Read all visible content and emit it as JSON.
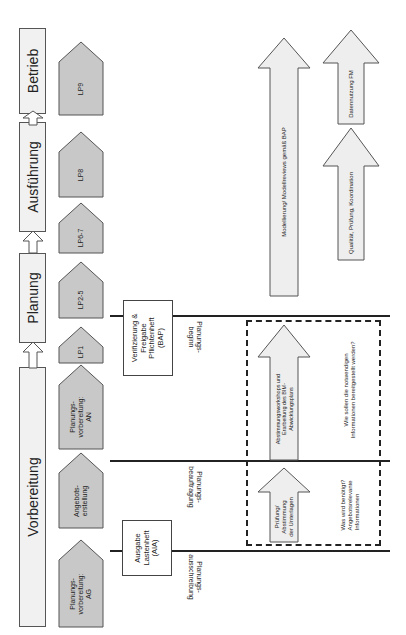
{
  "phases": [
    {
      "label": "Vorbereitung"
    },
    {
      "label": "Planung"
    },
    {
      "label": "Ausführung"
    },
    {
      "label": "Betrieb"
    }
  ],
  "steps": [
    {
      "label": "Planungs-\nvorbereitung:\nAG"
    },
    {
      "label": "Angebots-\nerstellung"
    },
    {
      "label": "Planungs-\nvorbereitung:\nAN"
    },
    {
      "label": "LP1"
    },
    {
      "label": "LP2-5"
    },
    {
      "label": "LP6-7"
    },
    {
      "label": "LP8"
    },
    {
      "label": "LP9"
    }
  ],
  "documents": [
    {
      "label": "Ausgabe\nLastenheft\n(AIA)"
    },
    {
      "label": "Verifizierung &\nFreigabe\nPflichtenheft\n(BAP)"
    }
  ],
  "milestones": [
    {
      "label": "Planungs-\nausschreibung"
    },
    {
      "label": "Planungs-\nbeauftragung"
    },
    {
      "label": "Planungs-\nbeginn"
    }
  ],
  "arrows": [
    {
      "label": "Prüfung/\nAbstimmung\nder Unterlagen"
    },
    {
      "label": "Abstimmungsworkshops und\nErarbeitung des BIM-\nAbwicklungsplans"
    },
    {
      "label": "Modellierung/ Modellreviews gemäß BAP"
    },
    {
      "label": "Qualität, Prüfung, Koordination"
    },
    {
      "label": "Datennutzung FM"
    }
  ],
  "notes": [
    {
      "label": "Was wird benötigt?\nAngebotsrelevante\nInformationen"
    },
    {
      "label": "Wie sollen die notwendigen\nInformationen bereitgestellt werden?"
    }
  ]
}
